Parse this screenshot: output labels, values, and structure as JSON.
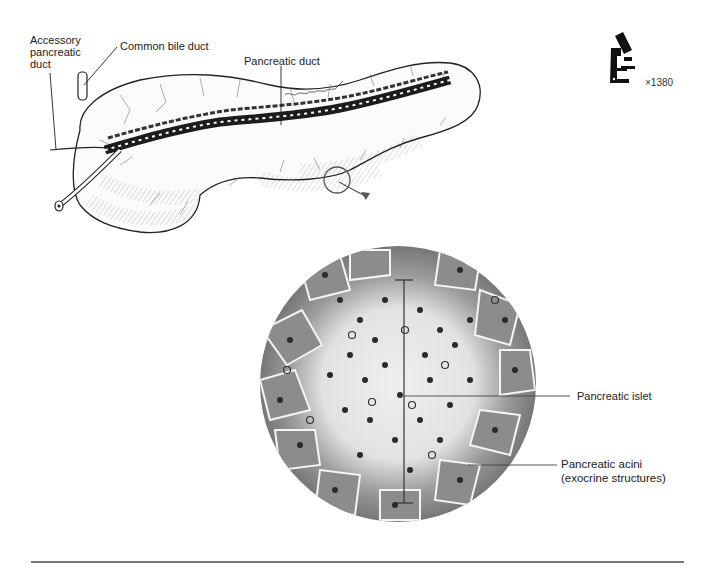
{
  "figure": {
    "top_diagram": {
      "title": "Pancreas gross anatomy",
      "labels": {
        "accessory_duct": "Accessory\npancreatic\nduct",
        "common_bile_duct": "Common bile duct",
        "pancreatic_duct": "Pancreatic duct"
      },
      "signature": "Doreen Davis"
    },
    "magnification": {
      "icon": "microscope-icon",
      "value": "×1380"
    },
    "micrograph": {
      "labels": {
        "islet": "Pancreatic islet",
        "acini": "Pancreatic acini\n(exocrine structures)"
      }
    },
    "colors": {
      "ink": "#222222",
      "tissue_dark": "#3a3a3a",
      "tissue_mid": "#8a8a8a",
      "tissue_light": "#e6e6e6",
      "rule": "#777777"
    }
  }
}
